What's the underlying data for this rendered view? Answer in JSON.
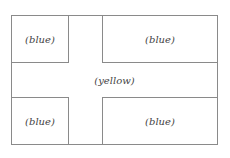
{
  "diagram": {
    "regions": [
      {
        "id": "top-left",
        "label": "(blue)"
      },
      {
        "id": "top-right",
        "label": "(blue)"
      },
      {
        "id": "middle",
        "label": "(yellow)"
      },
      {
        "id": "bottom-left",
        "label": "(blue)"
      },
      {
        "id": "bottom-right",
        "label": "(blue)"
      }
    ]
  }
}
